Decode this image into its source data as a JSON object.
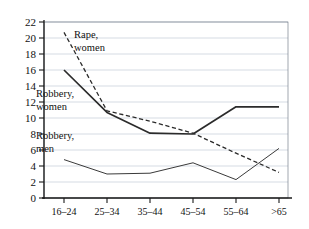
{
  "chart_data": {
    "type": "line",
    "title": "",
    "xlabel": "",
    "ylabel": "",
    "categories": [
      "16–24",
      "25–34",
      "35–44",
      "45–54",
      "55–64",
      ">65"
    ],
    "ylim": [
      0,
      22
    ],
    "ytick_step": 2,
    "yticks": [
      0,
      2,
      4,
      6,
      8,
      10,
      12,
      14,
      16,
      18,
      20,
      22
    ],
    "grid": true,
    "legend_position": "inline-annotations",
    "series": [
      {
        "name": "Rape, women",
        "style": "dashed",
        "values": [
          20.7,
          10.9,
          9.6,
          8.1,
          5.6,
          3.2
        ]
      },
      {
        "name": "Robbery, women",
        "style": "solid-thick",
        "values": [
          16.0,
          10.7,
          8.1,
          8.0,
          11.4,
          11.4
        ]
      },
      {
        "name": "Robbery, men",
        "style": "solid-thin",
        "values": [
          4.8,
          3.0,
          3.1,
          4.4,
          2.3,
          6.2
        ]
      }
    ],
    "annotations": [
      {
        "text_line1": "Rape,",
        "text_line2": "women",
        "x": 74,
        "y": 38
      },
      {
        "text_line1": "Robbery,",
        "text_line2": "women",
        "x": 36,
        "y": 97
      },
      {
        "text_line1": "Robbery,",
        "text_line2": "men",
        "x": 36,
        "y": 139
      }
    ]
  },
  "axis": {
    "ytick_labels": [
      "22",
      "20",
      "18",
      "16",
      "14",
      "12",
      "10",
      "8",
      "6",
      "4",
      "2",
      "0"
    ],
    "xtick_labels": [
      "16–24",
      "25–34",
      "35–44",
      "45–54",
      "55–64",
      ">65"
    ]
  },
  "colors": {
    "background": "#ffffff",
    "grid": "#b9c3d2",
    "axis": "#1a1a1a",
    "line_primary": "#2b2b2b",
    "line_secondary": "#3a3a3a",
    "border": "#555f6d"
  }
}
